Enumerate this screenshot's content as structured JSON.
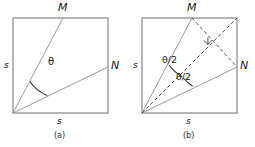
{
  "figure": {
    "width": 255,
    "height": 147,
    "background": "#ffffff",
    "square_side_length_label": "s",
    "colors": {
      "square_stroke": "#808080",
      "ray_stroke": "#999999",
      "dashed_stroke": "#3a3a3a",
      "arc_stroke": "#1a1a1a",
      "text": "#1a1a1a"
    }
  },
  "panel_a": {
    "caption": "(a)",
    "labels": {
      "vertex_m": "M",
      "vertex_n": "N",
      "side_left": "s",
      "side_bottom": "s",
      "angle": "θ"
    },
    "geometry": {
      "square": {
        "x": 13,
        "y": 18,
        "side": 95
      },
      "origin": {
        "x": 13,
        "y": 113
      },
      "point_m": {
        "x": 63,
        "y": 18
      },
      "point_n": {
        "x": 108,
        "y": 67
      },
      "angle_arc_radius": 38
    }
  },
  "panel_b": {
    "caption": "(b)",
    "labels": {
      "vertex_m": "M",
      "vertex_n": "N",
      "side_left": "s",
      "side_bottom": "s",
      "angle_upper": "θ/2",
      "angle_lower": "θ/2"
    },
    "geometry": {
      "square": {
        "x": 15,
        "y": 18,
        "side": 95
      },
      "origin": {
        "x": 15,
        "y": 113
      },
      "point_m": {
        "x": 65,
        "y": 18
      },
      "point_n": {
        "x": 110,
        "y": 67
      },
      "bisector_end": {
        "x": 110,
        "y": 18
      },
      "perpendicular_foot": {
        "x": 80,
        "y": 44
      },
      "right_angle_marker": {
        "x": 80,
        "y": 44,
        "size": 6
      }
    }
  }
}
